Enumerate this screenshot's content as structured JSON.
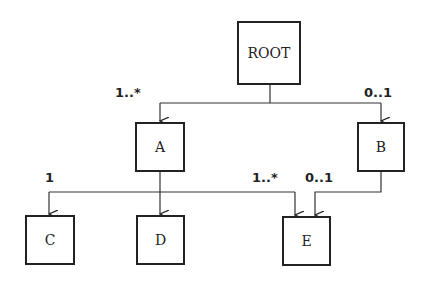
{
  "diagram": {
    "nodes": [
      {
        "id": "root",
        "label": "ROOT"
      },
      {
        "id": "a",
        "label": "A"
      },
      {
        "id": "b",
        "label": "B"
      },
      {
        "id": "c",
        "label": "C"
      },
      {
        "id": "d",
        "label": "D"
      },
      {
        "id": "e",
        "label": "E"
      }
    ],
    "edges": [
      {
        "from": "ROOT",
        "to": "A",
        "multiplicity": "1..*"
      },
      {
        "from": "ROOT",
        "to": "B",
        "multiplicity": "0..1"
      },
      {
        "from": "A",
        "to": "C",
        "multiplicity": "1"
      },
      {
        "from": "A",
        "to": "D",
        "multiplicity": ""
      },
      {
        "from": "A",
        "to": "E",
        "multiplicity": "1..*"
      },
      {
        "from": "B",
        "to": "E",
        "multiplicity": "0..1"
      }
    ],
    "labels": {
      "root_a": "1..*",
      "root_b": "0..1",
      "a_c": "1",
      "a_e": "1..*",
      "b_e": "0..1"
    }
  }
}
